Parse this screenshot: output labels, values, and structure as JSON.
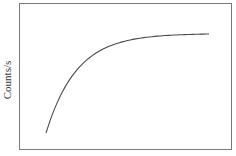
{
  "chart_data": {
    "type": "line",
    "title": "",
    "xlabel": "",
    "ylabel": "Counts/s",
    "grid": false,
    "legend": null,
    "x_ticks": [],
    "y_ticks": [],
    "xlim": [
      0,
      1
    ],
    "ylim": [
      0,
      1
    ],
    "series": [
      {
        "name": "counts",
        "shape": "exponential saturation (rises steeply then plateaus)",
        "x": [
          0.0,
          0.05,
          0.1,
          0.2,
          0.3,
          0.45,
          0.6,
          0.75,
          0.9,
          1.0
        ],
        "y": [
          0.0,
          0.24,
          0.42,
          0.62,
          0.74,
          0.86,
          0.93,
          0.965,
          0.985,
          0.995
        ]
      }
    ],
    "colors": {
      "line": "#4a4a4a",
      "frame": "#7a7a7a",
      "background": "#ffffff"
    }
  }
}
